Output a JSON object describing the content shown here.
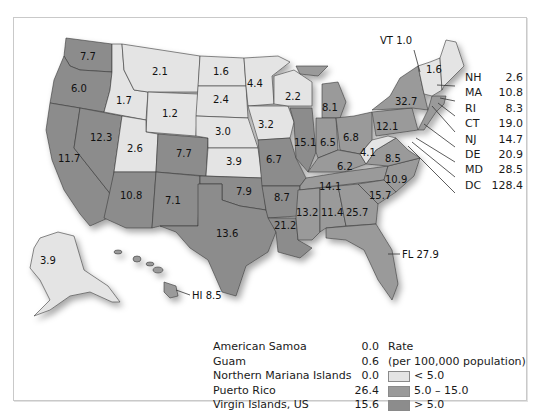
{
  "colors": {
    "low": "#e4e4e4",
    "mid": "#9a9a9a",
    "high": "#8c8c8c",
    "border": "#3a3a3a"
  },
  "states": {
    "WA": "7.7",
    "OR": "6.0",
    "CA": "11.7",
    "NV": "12.3",
    "ID": "1.7",
    "MT": "2.1",
    "WY": "1.2",
    "UT": "2.6",
    "CO": "7.7",
    "AZ": "10.8",
    "NM": "7.1",
    "ND": "1.6",
    "SD": "2.4",
    "NE": "3.0",
    "KS": "3.9",
    "OK": "7.9",
    "TX": "13.6",
    "MN": "4.4",
    "IA": "3.2",
    "MO": "6.7",
    "AR": "8.7",
    "LA": "21.2",
    "WI": "2.2",
    "IL": "15.1",
    "MI": "8.1",
    "IN": "6.5",
    "OH": "6.8",
    "KY": "6.2",
    "TN": "14.1",
    "MS": "13.2",
    "AL": "11.4",
    "GA": "25.7",
    "SC": "15.7",
    "NC": "10.9",
    "VA": "8.5",
    "WV": "4.1",
    "PA": "12.1",
    "NY": "32.7",
    "ME": "1.6",
    "AK": "3.9"
  },
  "callouts": {
    "vt": "VT 1.0",
    "hi": "HI 8.5",
    "fl": "FL 27.9"
  },
  "northeast_list": [
    {
      "abbr": "NH",
      "value": "2.6"
    },
    {
      "abbr": "MA",
      "value": "10.8"
    },
    {
      "abbr": "RI",
      "value": "8.3"
    },
    {
      "abbr": "CT",
      "value": "19.0"
    },
    {
      "abbr": "NJ",
      "value": "14.7"
    },
    {
      "abbr": "DE",
      "value": "20.9"
    },
    {
      "abbr": "MD",
      "value": "28.5"
    },
    {
      "abbr": "DC",
      "value": "128.4"
    }
  ],
  "territories": [
    {
      "name": "American Samoa",
      "value": "0.0"
    },
    {
      "name": "Guam",
      "value": "0.6"
    },
    {
      "name": "Northern Mariana Islands",
      "value": "0.0"
    },
    {
      "name": "Puerto Rico",
      "value": "26.4"
    },
    {
      "name": "Virgin Islands, US",
      "value": "15.6"
    }
  ],
  "legend": {
    "title": "Rate",
    "subtitle": "(per 100,000 population)",
    "items": [
      {
        "label": "< 5.0"
      },
      {
        "label": "5.0 – 15.0"
      },
      {
        "label": "> 5.0"
      }
    ]
  }
}
